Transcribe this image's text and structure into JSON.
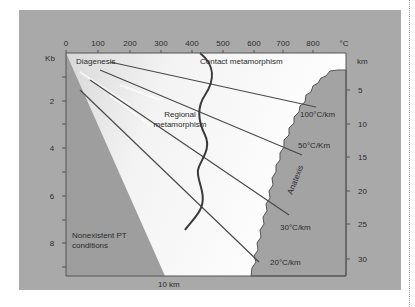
{
  "diagram": {
    "type": "pressure-temperature metamorphic facies diagram",
    "top_axis": {
      "unit": "°C",
      "ticks": [
        "0",
        "100",
        "200",
        "300",
        "400",
        "500",
        "600",
        "700",
        "800"
      ]
    },
    "left_axis": {
      "unit": "Kb",
      "ticks": [
        "2",
        "4",
        "6",
        "8"
      ]
    },
    "right_axis": {
      "unit": "km",
      "ticks": [
        "5",
        "10",
        "15",
        "20",
        "25",
        "30"
      ]
    },
    "regions": {
      "diagenesis": "Diagenesis",
      "contact": "Contact metamorphism",
      "regional_line1": "Regional",
      "regional_line2": "metamorphism",
      "nonexistent_line1": "Nonexistent PT",
      "nonexistent_line2": "conditions",
      "anatexis": "Anatexis"
    },
    "geotherms": [
      {
        "label": "100°C/km"
      },
      {
        "label": "50°C/Km"
      },
      {
        "label": "30°C/km"
      },
      {
        "label": "20°C/km"
      }
    ],
    "bottom_label": "10 km",
    "colors": {
      "panel": "#a9a9a9",
      "plot_light": "#f4f4f4",
      "nonexistent": "#9c9c9c",
      "anatexis": "#a3a3a3",
      "lines": "#444444"
    }
  }
}
